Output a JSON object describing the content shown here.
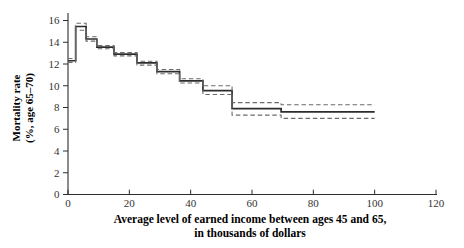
{
  "chart_data": {
    "type": "step-line",
    "title": "",
    "xlabel_line1": "Average level of earned income between ages 45 and 65,",
    "xlabel_line2": "in thousands of dollars",
    "ylabel_line1": "Mortality rate",
    "ylabel_line2": "(%, age 65–70)",
    "xlim": [
      0,
      120
    ],
    "ylim": [
      0,
      16
    ],
    "xticks": [
      0,
      20,
      40,
      60,
      80,
      100,
      120
    ],
    "yticks": [
      0,
      2,
      4,
      6,
      8,
      10,
      12,
      14,
      16
    ],
    "grid": false,
    "legend": "none",
    "bin_edges": [
      0,
      2.5,
      5.9,
      9.4,
      15,
      22.5,
      29,
      36.4,
      44,
      53.5,
      69.5,
      100
    ],
    "series": [
      {
        "name": "mortality-estimate",
        "style": "solid",
        "values": [
          12.3,
          15.45,
          14.3,
          13.55,
          12.9,
          12.1,
          11.3,
          10.45,
          9.55,
          7.9,
          7.6
        ]
      },
      {
        "name": "upper-confidence-band",
        "style": "dashed",
        "values": [
          12.5,
          15.75,
          14.5,
          13.7,
          13.05,
          12.25,
          11.5,
          10.65,
          10.0,
          8.45,
          8.25
        ]
      },
      {
        "name": "lower-confidence-band",
        "style": "dashed",
        "values": [
          12.15,
          15.1,
          14.1,
          13.4,
          12.75,
          11.9,
          11.1,
          10.25,
          9.2,
          7.3,
          7.0
        ]
      }
    ],
    "colors": {
      "solid_line": "#2d2d2d",
      "dashed_line": "#6b6b6b",
      "axis": "#2d2d2d",
      "tick_text": "#333333",
      "label_text": "#1e1e1e"
    }
  }
}
